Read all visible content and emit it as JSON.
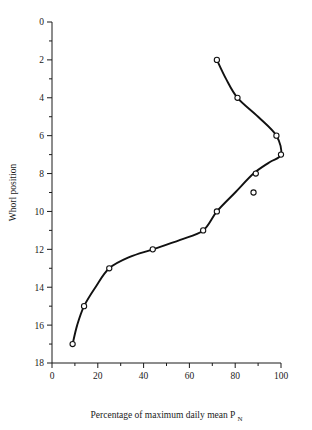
{
  "chart_data": {
    "type": "line",
    "title": "",
    "xlabel": "Percentage of maximum daily mean P",
    "xlabel_subscript": "N",
    "ylabel": "Whorl position",
    "xlim": [
      0,
      100
    ],
    "ylim": [
      0,
      18
    ],
    "y_inverted": true,
    "grid": false,
    "legend": null,
    "x_ticks_major": [
      0,
      20,
      40,
      60,
      80,
      100
    ],
    "x_ticks_minor": [
      10,
      30,
      50,
      70,
      90
    ],
    "y_ticks_major": [
      0,
      2,
      4,
      6,
      8,
      10,
      12,
      14,
      16,
      18
    ],
    "y_ticks_minor": [
      1,
      3,
      5,
      7,
      9,
      11,
      13,
      15,
      17
    ],
    "marker": "open-circle",
    "series": [
      {
        "name": "Whorl position vs percentage of maximum daily mean",
        "x": [
          9,
          14,
          25,
          44,
          66,
          72,
          88,
          89,
          100,
          98,
          81,
          72
        ],
        "y": [
          17,
          15,
          13,
          12,
          11,
          10,
          9,
          8,
          7,
          6,
          4,
          2
        ]
      }
    ],
    "points": [
      {
        "x": 9,
        "y": 17
      },
      {
        "x": 14,
        "y": 15
      },
      {
        "x": 25,
        "y": 13
      },
      {
        "x": 44,
        "y": 12
      },
      {
        "x": 66,
        "y": 11
      },
      {
        "x": 72,
        "y": 10
      },
      {
        "x": 88,
        "y": 9
      },
      {
        "x": 89,
        "y": 8
      },
      {
        "x": 100,
        "y": 7
      },
      {
        "x": 98,
        "y": 6
      },
      {
        "x": 81,
        "y": 4
      },
      {
        "x": 72,
        "y": 2
      }
    ],
    "fitted_curve": [
      {
        "x": 9,
        "y": 17
      },
      {
        "x": 11,
        "y": 16
      },
      {
        "x": 14,
        "y": 15
      },
      {
        "x": 19,
        "y": 14
      },
      {
        "x": 25,
        "y": 13
      },
      {
        "x": 34,
        "y": 12.4
      },
      {
        "x": 44,
        "y": 12
      },
      {
        "x": 56,
        "y": 11.5
      },
      {
        "x": 66,
        "y": 11
      },
      {
        "x": 72,
        "y": 10
      },
      {
        "x": 80,
        "y": 9
      },
      {
        "x": 88,
        "y": 8
      },
      {
        "x": 95,
        "y": 7.4
      },
      {
        "x": 100,
        "y": 7
      },
      {
        "x": 98,
        "y": 6
      },
      {
        "x": 90,
        "y": 5
      },
      {
        "x": 81,
        "y": 4
      },
      {
        "x": 76,
        "y": 3
      },
      {
        "x": 72,
        "y": 2
      }
    ],
    "colors": {
      "line": "#111111",
      "marker_fill": "#ffffff",
      "marker_stroke": "#111111",
      "axis": "#1a1a1a",
      "background": "#ffffff"
    }
  }
}
